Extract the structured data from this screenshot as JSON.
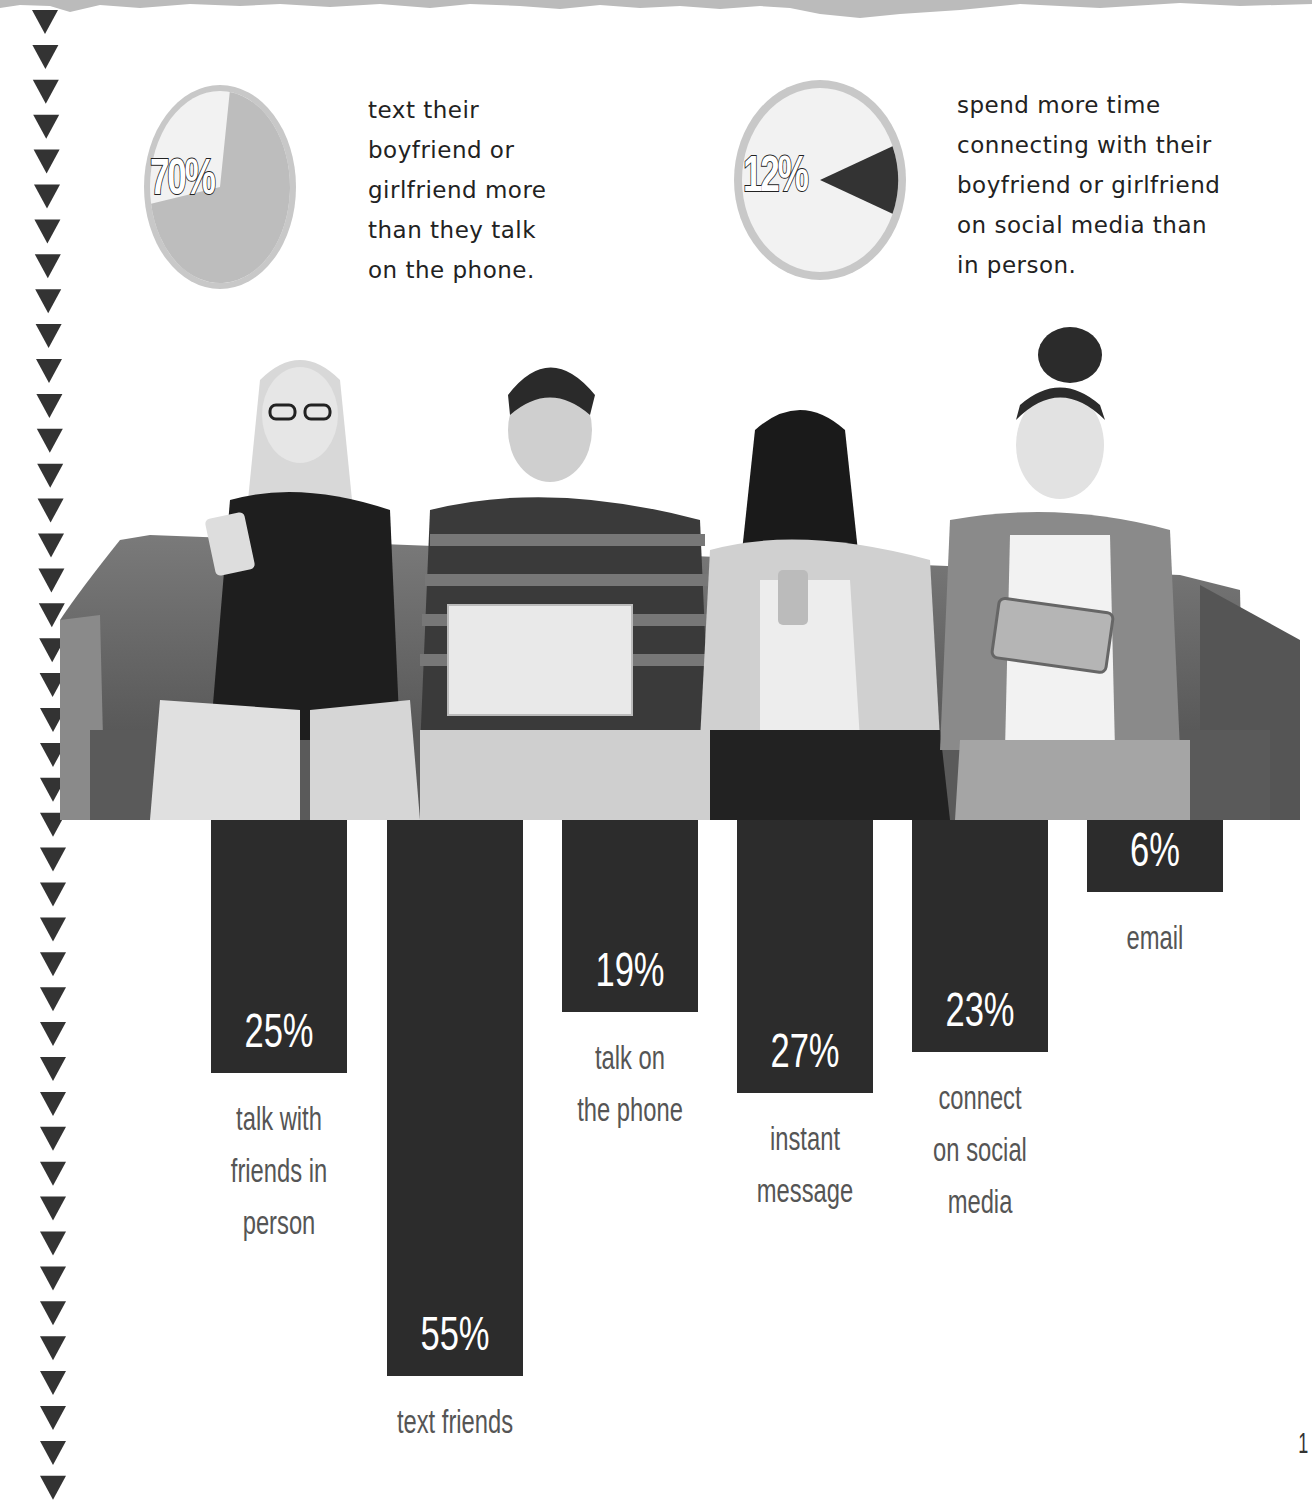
{
  "colors": {
    "bar": "#2c2c2c",
    "pie_fill": "#bdbdbd",
    "pie_rim": "#c8c8c8",
    "pie_highlight_dark": "#333333",
    "pie_empty": "#f2f2f2",
    "triangle": "#333333",
    "torn_paper": "#bbbbbb"
  },
  "stats": [
    {
      "value": "70%",
      "percent": 70,
      "caption_lines": [
        "text their",
        "boyfriend or",
        "girlfriend more",
        "than they talk",
        "on the phone."
      ]
    },
    {
      "value": "12%",
      "percent": 12,
      "caption_lines": [
        "spend more time",
        "connecting with their",
        "boyfriend or girlfriend",
        "on social media than",
        "in person."
      ]
    }
  ],
  "photo": {
    "description": "four teens on a sofa using phones, laptop and tablet"
  },
  "chart_data": [
    {
      "type": "pie",
      "title": "",
      "slices": [
        {
          "label": "text boyfriend/girlfriend more than talk on phone",
          "value": 70
        },
        {
          "label": "other",
          "value": 30
        }
      ]
    },
    {
      "type": "pie",
      "title": "",
      "slices": [
        {
          "label": "more time connecting on social media than in person",
          "value": 12
        },
        {
          "label": "other",
          "value": 88
        }
      ]
    },
    {
      "type": "bar",
      "orientation": "vertical-downward",
      "title": "",
      "xlabel": "",
      "ylabel": "",
      "grid": false,
      "categories": [
        "talk with friends in person",
        "text friends",
        "talk on the phone",
        "instant message",
        "connect on social media",
        "email"
      ],
      "values": [
        25,
        55,
        19,
        27,
        23,
        6
      ],
      "value_labels": [
        "25%",
        "55%",
        "19%",
        "27%",
        "23%",
        "6%"
      ],
      "ylim": [
        0,
        60
      ]
    }
  ],
  "bars": [
    {
      "value": "25%",
      "label_lines": [
        "talk with",
        "friends in",
        "person"
      ]
    },
    {
      "value": "55%",
      "label_lines": [
        "text friends"
      ]
    },
    {
      "value": "19%",
      "label_lines": [
        "talk on",
        "the phone"
      ]
    },
    {
      "value": "27%",
      "label_lines": [
        "instant",
        "message"
      ]
    },
    {
      "value": "23%",
      "label_lines": [
        "connect",
        "on social",
        "media"
      ]
    },
    {
      "value": "6%",
      "label_lines": [
        "email"
      ]
    }
  ],
  "page": {
    "number": "1"
  }
}
